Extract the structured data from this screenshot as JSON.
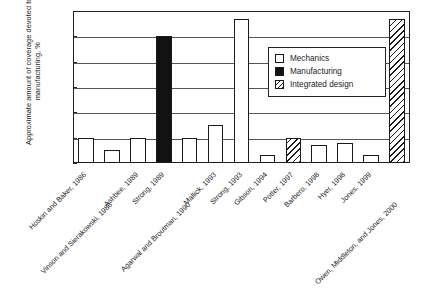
{
  "chart_data": {
    "type": "bar",
    "title": "",
    "subtitle": "",
    "xlabel": "",
    "ylabel": "Approximate amount of coverage devoted to manufacturing, %",
    "ylim": [
      0,
      60
    ],
    "yticks": [
      0,
      10,
      20,
      30,
      40,
      50,
      60
    ],
    "ytick_labels": [
      "0",
      "10",
      "20",
      "30",
      "40",
      "50",
      "60"
    ],
    "grid": "horizontal",
    "legend_position": "inside-upper-right",
    "categories": [
      "Hoskin and Baker, 1986",
      "Vinson and Sierakowski, 1986",
      "Ashbee, 1989",
      "Strong, 1989",
      "Agarwal and Broutman, 1990",
      "Mallick, 1993",
      "Strong, 1993",
      "Gibson, 1994",
      "Potter, 1997",
      "Barbero, 1998",
      "Hyer, 1998",
      "Jones, 1999",
      "Owen, Middleton, and Jones, 2000"
    ],
    "values": [
      10,
      5,
      10,
      50,
      10,
      15,
      57,
      3,
      10,
      7,
      8,
      3,
      57
    ],
    "bar_types": [
      "mechanics",
      "mechanics",
      "mechanics",
      "manufacturing",
      "mechanics",
      "mechanics",
      "mechanics",
      "mechanics",
      "integrated",
      "mechanics",
      "mechanics",
      "mechanics",
      "integrated"
    ],
    "series": [
      {
        "name": "Mechanics",
        "key": "mechanics"
      },
      {
        "name": "Manufacturing",
        "key": "manufacturing"
      },
      {
        "name": "Integrated design",
        "key": "integrated"
      }
    ],
    "legend": [
      {
        "label": "Mechanics",
        "key": "mechanics"
      },
      {
        "label": "Manufacturing",
        "key": "manufacturing"
      },
      {
        "label": "Integrated design",
        "key": "integrated"
      }
    ]
  },
  "colors": {
    "axis": "#222222",
    "grid": "#555555",
    "mechanics": "#ffffff",
    "manufacturing": "#121212",
    "integrated": "#ffffff",
    "text": "#1d1d1d",
    "background": "#ffffff"
  }
}
